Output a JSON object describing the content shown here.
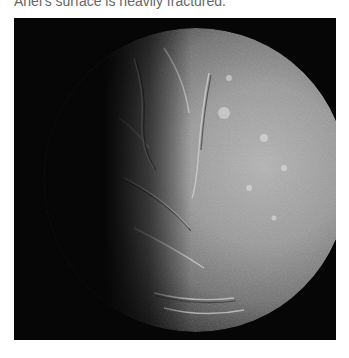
{
  "caption": {
    "text": "Ariel's surface is heavily fractured."
  },
  "photo": {
    "subject": "Ariel moon surface",
    "alt": "Grayscale image of Ariel, lit from the right, showing a fractured, cratered surface"
  },
  "colors": {
    "background": "#ffffff",
    "caption_text": "#666666",
    "space": "#060606"
  }
}
